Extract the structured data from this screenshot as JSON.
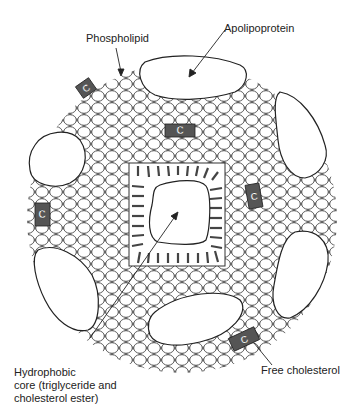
{
  "figure": {
    "labels": {
      "phospholipid": "Phospholipid",
      "apolipoprotein": "Apolipoprotein",
      "hydrophobic_core": "Hydrophobic\ncore (triglyceride and\ncholesterol ester)",
      "free_cholesterol": "Free cholesterol"
    },
    "cholesterol_marker_glyph": "C",
    "colors": {
      "outline": "#222222",
      "cholesterol_fill": "#555555",
      "background": "#ffffff"
    }
  }
}
